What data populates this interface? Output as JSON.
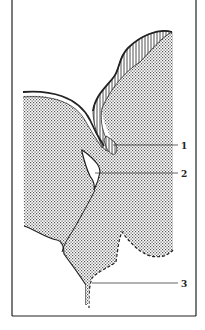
{
  "diagram": {
    "type": "anatomical-section",
    "frame": {
      "left": 12,
      "right": 196,
      "bottom": 316
    },
    "labels": [
      {
        "id": "1",
        "text": "1",
        "x": 183,
        "y": 149
      },
      {
        "id": "2",
        "text": "2",
        "x": 183,
        "y": 176
      },
      {
        "id": "3",
        "text": "3",
        "x": 183,
        "y": 286
      }
    ],
    "colors": {
      "ink": "#222222",
      "background": "#ffffff",
      "stipple": "#555555"
    }
  }
}
